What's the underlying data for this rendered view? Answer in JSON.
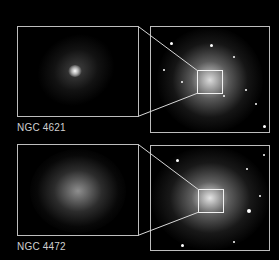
{
  "panels": [
    {
      "name": "NGC 4621",
      "label": "NGC 4621",
      "description": "Elliptical galaxy with bright compact nucleus; inset shows zoomed core region"
    },
    {
      "name": "NGC 4472",
      "label": "NGC 4472",
      "description": "Large elliptical galaxy with diffuse core; inset shows zoomed core region"
    }
  ],
  "colors": {
    "background": "#000000",
    "frame": "#bdbdbd",
    "zoom_box": "#f2f2f2",
    "label": "#cfcfcf"
  }
}
